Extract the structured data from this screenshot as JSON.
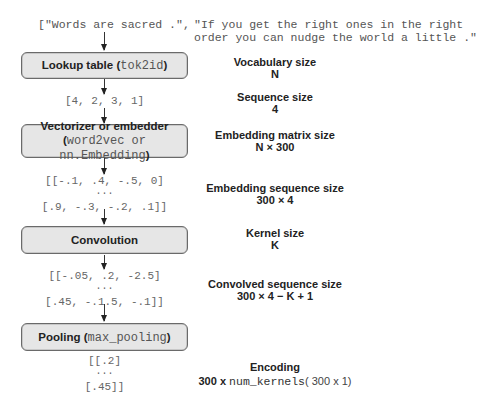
{
  "inputs": {
    "sentence_1": "[\"Words are sacred .\",",
    "sentence_2_line_1": "\"If you get the right ones in the right",
    "sentence_2_line_2": "order you can nudge the world a little .\""
  },
  "pipeline": [
    {
      "name": "Lookup table",
      "code": "tok2id",
      "output_lines": [
        "[4, 2, 3, 1]"
      ]
    },
    {
      "name": "Vectorizer or embedder",
      "code_line": "word2vec or nn.Embedding",
      "output_lines": [
        "[[-.1, .4, -.5, 0]",
        "...",
        "[.9, -.3, -.2, .1]]"
      ]
    },
    {
      "name": "Convolution",
      "output_lines": [
        "[[-.05, .2, -2.5]",
        "...",
        "[.45, -.1.5, -.1]]"
      ]
    },
    {
      "name": "Pooling",
      "code": "max_pooling",
      "output_lines": [
        "[[.2]",
        "...",
        "[.45]]"
      ]
    }
  ],
  "annotations": [
    {
      "title": "Vocabulary size",
      "value": "N"
    },
    {
      "title": "Sequence size",
      "value": "4"
    },
    {
      "title": "Embedding matrix size",
      "value": "N × 300"
    },
    {
      "title": "Embedding sequence size",
      "value": "300 × 4"
    },
    {
      "title": "Kernel size",
      "value": "K"
    },
    {
      "title": "Convolved sequence size",
      "value": "300 × 4 − K + 1"
    },
    {
      "title": "Encoding",
      "value_prefix": "300 x ",
      "value_code": "num_kernels",
      "value_suffix": "( 300 x 1)"
    }
  ],
  "paren_open": "(",
  "paren_close": ")",
  "colors": {
    "box_fill": "#e6e6e6",
    "box_border": "#6a6a6a",
    "code_text": "#666666",
    "label_text": "#222222"
  }
}
